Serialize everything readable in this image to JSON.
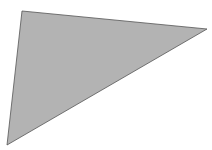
{
  "diagram": {
    "shape": "triangle",
    "fill_color": "#b3b3b3",
    "stroke_color": "#555555",
    "background_color": "#ffffff",
    "top_text_clipped": ""
  }
}
